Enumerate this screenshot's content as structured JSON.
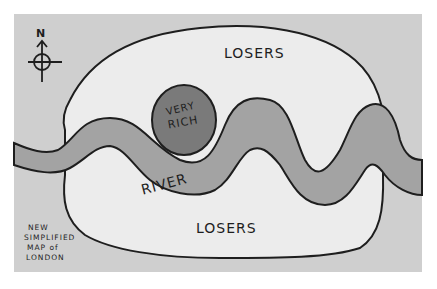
{
  "map": {
    "title_lines": [
      "NEW",
      "SIMPLIFIED",
      "MAP of",
      "LONDON"
    ],
    "compass": {
      "label": "N",
      "icon": "compass-rose-icon"
    },
    "regions": {
      "north": {
        "label": "LOSERS"
      },
      "south": {
        "label": "LOSERS"
      },
      "center": {
        "label_line1": "VERY",
        "label_line2": "RICH"
      },
      "river": {
        "label": "RIVER"
      }
    },
    "colors": {
      "paper_background": "#cfcfcf",
      "border_white": "#ffffff",
      "land_light": "#ececec",
      "river_gray": "#a3a3a3",
      "rich_dark": "#7a7a7a",
      "ink": "#1e1e1e"
    }
  }
}
